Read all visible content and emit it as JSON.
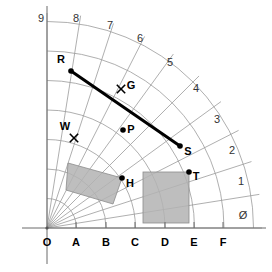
{
  "figure": {
    "background": "#ffffff",
    "grid_color": "#9a9a9a",
    "axis_color": "#6b6b6b",
    "accent_color": "#000000",
    "shade_fill": "#b3b3b3",
    "shade_stroke": "#8c8c8c",
    "origin": {
      "x": 47,
      "y": 228,
      "label": "O"
    }
  },
  "axes": {
    "x_axis": {
      "y": 228,
      "x_start": 22,
      "x_end": 266
    },
    "y_axis": {
      "x": 47,
      "y_start": 6,
      "y_end": 264
    },
    "x_ticks": [
      {
        "label": "O",
        "x": 47
      },
      {
        "label": "A",
        "x": 76
      },
      {
        "label": "B",
        "x": 106
      },
      {
        "label": "C",
        "x": 135
      },
      {
        "label": "D",
        "x": 165
      },
      {
        "label": "E",
        "x": 194
      },
      {
        "label": "F",
        "x": 223
      }
    ],
    "x_tick_label_y": 246,
    "tick_mark_top": 222,
    "tick_mark_bottom": 228
  },
  "radials": {
    "count": 11,
    "labels": [
      {
        "text": "9",
        "x": 41,
        "y": 22,
        "angle_deg": 90.0
      },
      {
        "text": "8",
        "x": 76,
        "y": 22,
        "angle_deg": 81.0
      },
      {
        "text": "7",
        "x": 110,
        "y": 29,
        "angle_deg": 72.0
      },
      {
        "text": "6",
        "x": 140,
        "y": 42,
        "angle_deg": 63.0
      },
      {
        "text": "5",
        "x": 170,
        "y": 66,
        "angle_deg": 54.0
      },
      {
        "text": "4",
        "x": 196,
        "y": 92,
        "angle_deg": 45.0
      },
      {
        "text": "3",
        "x": 217,
        "y": 123,
        "angle_deg": 36.0
      },
      {
        "text": "2",
        "x": 232,
        "y": 154,
        "angle_deg": 27.0
      },
      {
        "text": "1",
        "x": 241,
        "y": 185,
        "angle_deg": 18.0
      },
      {
        "text": "Ø",
        "x": 243,
        "y": 219,
        "angle_deg": 9.0
      }
    ],
    "angles_deg": [
      90,
      81,
      72,
      63,
      54,
      45,
      36,
      27,
      18,
      9,
      0
    ],
    "length": 215
  },
  "arcs": {
    "radii": [
      29.5,
      59,
      88.5,
      118,
      147.5,
      177,
      206.5
    ],
    "sweep_start_deg": 0,
    "sweep_end_deg": 90
  },
  "points": [
    {
      "name": "R",
      "marker": "dot",
      "x": 71,
      "y": 71,
      "label": "R",
      "label_x": 61,
      "label_y": 63
    },
    {
      "name": "G",
      "marker": "cross",
      "x": 121,
      "y": 89,
      "label": "G",
      "label_x": 131,
      "label_y": 89
    },
    {
      "name": "P",
      "marker": "dot",
      "x": 123,
      "y": 130,
      "label": "P",
      "label_x": 131,
      "label_y": 133
    },
    {
      "name": "W",
      "marker": "cross",
      "x": 74,
      "y": 138,
      "label": "W",
      "label_x": 65,
      "label_y": 130
    },
    {
      "name": "S",
      "marker": "dot",
      "x": 180,
      "y": 146,
      "label": "S",
      "label_x": 188,
      "label_y": 155
    },
    {
      "name": "H",
      "marker": "dot",
      "x": 122,
      "y": 178,
      "label": "H",
      "label_x": 130,
      "label_y": 187
    },
    {
      "name": "T",
      "marker": "dot",
      "x": 189,
      "y": 172,
      "label": "T",
      "label_x": 196,
      "label_y": 180
    }
  ],
  "segments": [
    {
      "name": "RS",
      "from": "R",
      "x1": 71,
      "y1": 71,
      "x2": 180,
      "y2": 146,
      "width": 3,
      "color": "#000000"
    }
  ],
  "shaded_regions": [
    {
      "name": "tilted-quad",
      "shape": "polygon",
      "points": "68,163 122,178 113,204 66,190",
      "fill": "#b3b3b3",
      "opacity": 0.85
    },
    {
      "name": "axis-rect",
      "shape": "rect",
      "x": 143,
      "y": 172,
      "width": 46,
      "height": 51,
      "fill": "#b3b3b3",
      "opacity": 0.85
    }
  ],
  "origin_label": {
    "text": "O",
    "x": 47,
    "y": 246
  }
}
